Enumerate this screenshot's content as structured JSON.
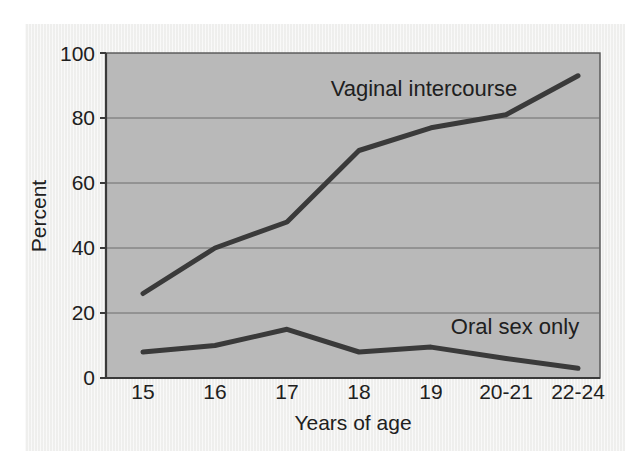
{
  "chart_data": {
    "type": "line",
    "title": "",
    "xlabel": "Years of age",
    "ylabel": "Percent",
    "categories": [
      "15",
      "16",
      "17",
      "18",
      "19",
      "20-21",
      "22-24"
    ],
    "x_tick_labels": [
      "15",
      "16",
      "17",
      "18",
      "19",
      "20-21",
      "22-24"
    ],
    "y_tick_labels": [
      "0",
      "20",
      "40",
      "60",
      "80",
      "100"
    ],
    "y_ticks": [
      0,
      20,
      40,
      60,
      80,
      100
    ],
    "ylim": [
      0,
      100
    ],
    "grid": "horizontal",
    "legend": "inline-annotation",
    "plot_background_color": "#b8b8b8",
    "line_color": "#3a3a3a",
    "gridline_color": "#6f6f6f",
    "series": [
      {
        "name": "Vaginal intercourse",
        "label_position": "above-line-center",
        "values": [
          26,
          40,
          48,
          70,
          77,
          81,
          93
        ]
      },
      {
        "name": "Oral sex only",
        "label_position": "above-line-right",
        "values": [
          8,
          10,
          15,
          8,
          9.5,
          6,
          3
        ]
      }
    ],
    "annotations": [
      {
        "text": "Vaginal intercourse",
        "x_value": "18",
        "y_value": 88
      },
      {
        "text": "Oral sex only",
        "x_value": "20-21",
        "y_value": 18
      }
    ]
  },
  "axes": {
    "y_axis_title": "Percent",
    "x_axis_title": "Years of age"
  }
}
